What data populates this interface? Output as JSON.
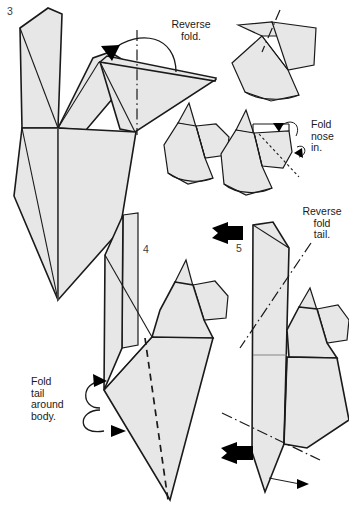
{
  "page": {
    "background_color": "#ffffff",
    "paper_fill_color": "#e7e7e7",
    "line_color": "#1a1a1a",
    "crease_color": "#7a7a7a",
    "width": 349,
    "height": 527
  },
  "steps": [
    {
      "id": "step-3",
      "number": "3",
      "number_pos": {
        "x": 7,
        "y": 15
      }
    },
    {
      "id": "step-4",
      "number": "4",
      "number_pos": {
        "x": 143,
        "y": 253
      }
    },
    {
      "id": "step-5",
      "number": "5",
      "number_pos": {
        "x": 236,
        "y": 252
      }
    }
  ],
  "captions": [
    {
      "id": "caption-reverse-fold",
      "lines": [
        "Reverse",
        "fold."
      ],
      "x": 191,
      "y": 28,
      "anchor": "middle"
    },
    {
      "id": "caption-fold-nose-in",
      "lines": [
        "Fold",
        "nose",
        "in."
      ],
      "x": 311,
      "y": 128,
      "anchor": "start"
    },
    {
      "id": "caption-reverse-fold-tail",
      "lines": [
        "Reverse",
        "fold",
        "tail."
      ],
      "x": 322,
      "y": 215,
      "anchor": "middle"
    },
    {
      "id": "caption-fold-tail-around-body",
      "lines": [
        "Fold",
        "tail",
        "around",
        "body."
      ],
      "x": 31,
      "y": 385,
      "anchor": "start"
    }
  ],
  "caption_line_height": 11.5,
  "markers": {
    "turn_arrow_step4": "solid-triangle-right",
    "turn_arrow_step5": "solid-triangle-right",
    "small_open_arrow": "thin-open-arrow-right"
  }
}
